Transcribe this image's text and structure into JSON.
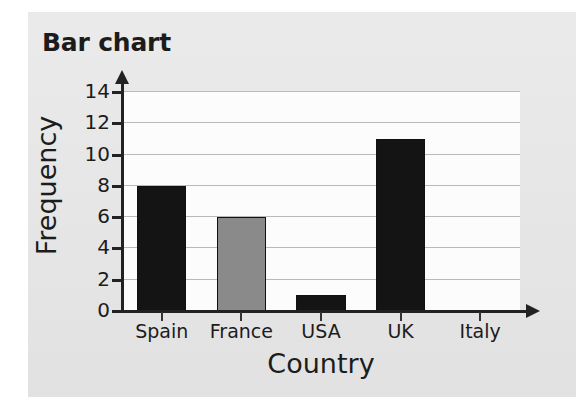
{
  "chart_data": {
    "type": "bar",
    "title": "Bar chart",
    "xlabel": "Country",
    "ylabel": "Frequency",
    "categories": [
      "Spain",
      "France",
      "USA",
      "UK",
      "Italy"
    ],
    "values": [
      8,
      6,
      1,
      11,
      0
    ],
    "bar_colors": [
      "#141414",
      "#8a8a8a",
      "#141414",
      "#141414",
      "#141414"
    ],
    "ylim": [
      0,
      14
    ],
    "ytick_labels": [
      "0",
      "2",
      "4",
      "6",
      "8",
      "10",
      "12",
      "14"
    ],
    "ytick_values": [
      0,
      2,
      4,
      6,
      8,
      10,
      12,
      14
    ],
    "grid": true,
    "grid_axis": "y",
    "legend": "none",
    "axis_arrows": true
  },
  "colors": {
    "page_background": "#ffffff",
    "card_background": "#e6e6e6",
    "plot_background": "#fcfcfc",
    "gridline": "#b9b9b9",
    "axis": "#222222",
    "text": "#1c1c1c",
    "bar_dark": "#141414",
    "bar_gray": "#8a8a8a"
  }
}
